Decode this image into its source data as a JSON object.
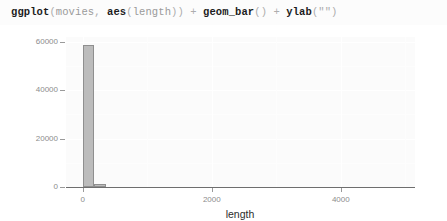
{
  "code": {
    "full_text": "ggplot(movies, aes(length)) + geom_bar() + ylab(\"\")",
    "tokens": [
      {
        "text": "ggplot",
        "kind": "fn"
      },
      {
        "text": "(",
        "kind": "punct"
      },
      {
        "text": "movies",
        "kind": "arg"
      },
      {
        "text": ", ",
        "kind": "punct"
      },
      {
        "text": "aes",
        "kind": "fn"
      },
      {
        "text": "(",
        "kind": "punct"
      },
      {
        "text": "length",
        "kind": "arg"
      },
      {
        "text": ")) + ",
        "kind": "punct"
      },
      {
        "text": "geom_bar",
        "kind": "fn"
      },
      {
        "text": "() + ",
        "kind": "punct"
      },
      {
        "text": "ylab",
        "kind": "fn"
      },
      {
        "text": "(\"\")",
        "kind": "punct"
      }
    ]
  },
  "chart_data": {
    "type": "bar",
    "title": "",
    "xlabel": "length",
    "ylabel": "",
    "xlim": [
      -260,
      5150
    ],
    "ylim": [
      0,
      62000
    ],
    "x_ticks": [
      0,
      2000,
      4000
    ],
    "x_tick_labels": [
      "0",
      "2000",
      "4000"
    ],
    "y_ticks": [
      0,
      20000,
      40000,
      60000
    ],
    "y_tick_labels": [
      "0",
      "20000",
      "40000",
      "60000"
    ],
    "grid": true,
    "legend": "none",
    "bar_fill": "#bcbcbc",
    "bar_outline": "#8f8f8f",
    "panel_background": "#fbfbfb",
    "bars": [
      {
        "x": 90,
        "value": 58500,
        "width": 180
      },
      {
        "x": 270,
        "value": 1400,
        "width": 190
      }
    ]
  },
  "axis": {
    "x_title": "length"
  }
}
